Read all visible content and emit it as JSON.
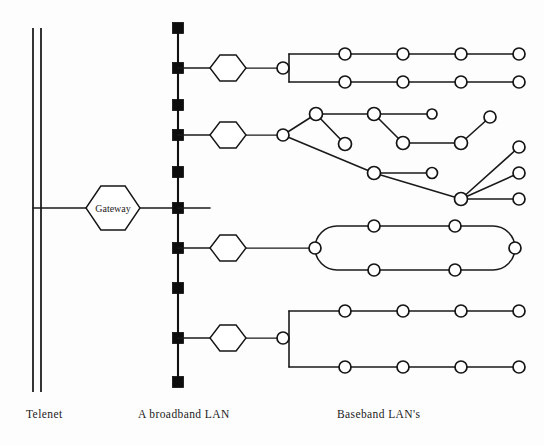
{
  "figure": {
    "title_fragment": "",
    "background_color": "#fdfdfd",
    "ink_color": "#141414",
    "width": 544,
    "height": 446
  },
  "captions": [
    {
      "id": "telenet",
      "label": "Telenet",
      "x": 26,
      "y": 418
    },
    {
      "id": "broadband",
      "label": "A broadband LAN",
      "x": 138,
      "y": 418
    },
    {
      "id": "baseband",
      "label": "Baseband LAN's",
      "x": 337,
      "y": 418
    }
  ],
  "telenet": {
    "name": "Telenet",
    "line_left_x": 33,
    "line_right_x": 41,
    "top_y": 28,
    "bottom_y": 392,
    "drop_y": 208,
    "drop_to_x": 88
  },
  "gateway": {
    "label": "Gateway",
    "cx": 113,
    "cy": 208,
    "rx": 27,
    "ry": 22,
    "link_left_x": 41,
    "link_right_x": 178
  },
  "broadband_bus": {
    "name": "A broadband LAN",
    "x": 178,
    "top_y": 28,
    "bottom_y": 382,
    "tap_size": 11,
    "taps": [
      {
        "y": 28,
        "branch": false
      },
      {
        "y": 68,
        "branch": true
      },
      {
        "y": 105,
        "branch": false
      },
      {
        "y": 135,
        "branch": true
      },
      {
        "y": 172,
        "branch": false
      },
      {
        "y": 208,
        "branch": true
      },
      {
        "y": 248,
        "branch": true
      },
      {
        "y": 288,
        "branch": false
      },
      {
        "y": 338,
        "branch": true
      },
      {
        "y": 382,
        "branch": false
      }
    ]
  },
  "hexagons": [
    {
      "id": "hex-bus-1",
      "cx": 228,
      "cy": 68,
      "rx": 18,
      "ry": 13
    },
    {
      "id": "hex-bus-2",
      "cx": 228,
      "cy": 135,
      "rx": 18,
      "ry": 13
    },
    {
      "id": "hex-bus-3",
      "cx": 228,
      "cy": 248,
      "rx": 18,
      "ry": 13
    },
    {
      "id": "hex-bus-4",
      "cx": 228,
      "cy": 338,
      "rx": 18,
      "ry": 13
    }
  ],
  "baseband_lans": [
    {
      "id": "lan-bus-top",
      "type": "dual-bus",
      "stem": {
        "from_x": 246,
        "to_x": 278,
        "y": 68
      },
      "hub": {
        "cx": 283,
        "cy": 68,
        "r": 6
      },
      "riser_x": 289,
      "upper_y": 54,
      "lower_y": 82,
      "upper_nodes": [
        345,
        403,
        461,
        519
      ],
      "lower_nodes": [
        345,
        403,
        461,
        519
      ],
      "line_start_x": 289,
      "line_end_x": 519
    },
    {
      "id": "lan-tree",
      "type": "tree",
      "stem": {
        "from_x": 246,
        "to_x": 278,
        "y": 135
      },
      "hub": {
        "cx": 283,
        "cy": 135,
        "r": 6
      },
      "nodes": [
        {
          "id": "t-a",
          "cx": 316,
          "cy": 114,
          "r": 6.5
        },
        {
          "id": "t-b",
          "cx": 345,
          "cy": 144,
          "r": 6.5
        },
        {
          "id": "t-c",
          "cx": 374,
          "cy": 114,
          "r": 6.5
        },
        {
          "id": "t-d",
          "cx": 432,
          "cy": 114,
          "r": 5
        },
        {
          "id": "t-e",
          "cx": 403,
          "cy": 143,
          "r": 6.5
        },
        {
          "id": "t-f",
          "cx": 461,
          "cy": 143,
          "r": 6.5
        },
        {
          "id": "t-g",
          "cx": 490,
          "cy": 117,
          "r": 6
        },
        {
          "id": "t-h",
          "cx": 374,
          "cy": 173,
          "r": 6.5
        },
        {
          "id": "t-i",
          "cx": 432,
          "cy": 173,
          "r": 5.5
        },
        {
          "id": "t-j",
          "cx": 461,
          "cy": 199,
          "r": 6.5
        },
        {
          "id": "t-k",
          "cx": 519,
          "cy": 147,
          "r": 6
        },
        {
          "id": "t-l",
          "cx": 519,
          "cy": 173,
          "r": 6
        },
        {
          "id": "t-m",
          "cx": 519,
          "cy": 199,
          "r": 6
        }
      ],
      "edges": [
        [
          "hub",
          "t-a"
        ],
        [
          "t-a",
          "t-b"
        ],
        [
          "t-a",
          "t-c"
        ],
        [
          "t-c",
          "t-d"
        ],
        [
          "t-c",
          "t-e"
        ],
        [
          "t-e",
          "t-f"
        ],
        [
          "t-f",
          "t-g"
        ],
        [
          "hub",
          "t-h"
        ],
        [
          "t-h",
          "t-i"
        ],
        [
          "t-h",
          "t-j"
        ],
        [
          "t-j",
          "t-k"
        ],
        [
          "t-j",
          "t-l"
        ],
        [
          "t-j",
          "t-m"
        ]
      ]
    },
    {
      "id": "lan-ring",
      "type": "ring",
      "stem": {
        "from_x": 246,
        "to_x": 310,
        "y": 248
      },
      "hub": {
        "cx": 315,
        "cy": 248,
        "r": 6
      },
      "ring_left_x": 315,
      "ring_right_x": 515,
      "ring_top_y": 226,
      "ring_bottom_y": 270,
      "corner_radius": 22,
      "top_nodes": [
        374,
        455
      ],
      "bottom_nodes": [
        374,
        455
      ],
      "right_node": {
        "cx": 515,
        "cy": 248,
        "r": 6
      }
    },
    {
      "id": "lan-bus-bottom",
      "type": "dual-bus",
      "stem": {
        "from_x": 246,
        "to_x": 278,
        "y": 338
      },
      "hub": {
        "cx": 283,
        "cy": 338,
        "r": 6
      },
      "riser_x": 289,
      "upper_y": 311,
      "lower_y": 367,
      "upper_nodes": [
        345,
        403,
        461,
        519
      ],
      "lower_nodes": [
        345,
        403,
        461,
        519
      ],
      "line_start_x": 289,
      "line_end_x": 519
    }
  ]
}
